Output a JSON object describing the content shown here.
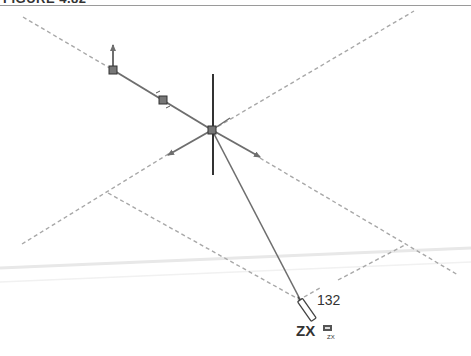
{
  "figure": {
    "title": "FIGURE 4.82"
  },
  "sketch": {
    "dimension_value": "132",
    "plane_label": "ZX",
    "plane_icon": "plane-zx-icon",
    "plane_icon_text": "ZX"
  },
  "colors": {
    "construction_line": "#a8a8a8",
    "sketch_line": "#6e6e6e",
    "axis_line": "#333333",
    "guide_band": "#ececec"
  }
}
